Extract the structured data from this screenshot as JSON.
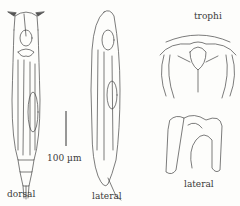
{
  "figure": {
    "labels": {
      "dorsal": "dorsal",
      "lateral_body": "lateral",
      "trophi": "trophi",
      "lateral_trophi": "lateral",
      "scale_bar": "100 µm"
    },
    "scale_bar_length_um": 100,
    "colors": {
      "ink": "#3a3a3a",
      "background": "#fdfdfb"
    }
  }
}
